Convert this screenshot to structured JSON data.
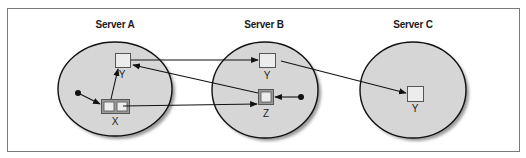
{
  "diagram": {
    "colors": {
      "frame": "#7a7a7a",
      "server_fill": "#d6d6d6",
      "server_stroke": "#111111",
      "server_shadow": "#9a9a9a",
      "object_fill": "#ececec",
      "object_stroke": "#555555",
      "compound_fill": "#9a9a9a",
      "line": "#111111"
    },
    "servers": [
      {
        "id": "A",
        "label": "Server A"
      },
      {
        "id": "B",
        "label": "Server B"
      },
      {
        "id": "C",
        "label": "Server C"
      }
    ],
    "objects": {
      "a_y": {
        "label": "Y"
      },
      "a_x": {
        "label": "X"
      },
      "b_y": {
        "label": "Y"
      },
      "b_z": {
        "label": "Z"
      },
      "c_y": {
        "label": "Y"
      }
    },
    "arrows": [
      {
        "from": "Server A / Y",
        "to": "Server B / Y"
      },
      {
        "from": "Server B / Z",
        "to": "Server A / Y"
      },
      {
        "from": "Server A / X (right slot)",
        "to": "Server B / Z"
      },
      {
        "from": "Server B / Y",
        "to": "Server C / Y"
      },
      {
        "from": "Server A / root reference",
        "to": "Server A / X"
      },
      {
        "from": "Server A / X (left slot)",
        "to": "Server A / Y"
      },
      {
        "from": "Server B / root reference",
        "to": "Server B / Z"
      }
    ]
  }
}
